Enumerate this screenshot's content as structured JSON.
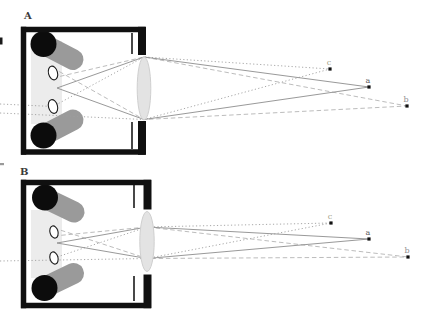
{
  "figure": {
    "canvas": {
      "width": 431,
      "height": 323,
      "bg": "#ffffff"
    },
    "colors": {
      "wall": "#101010",
      "septum": "#1a1a1a",
      "slab": "#ececec",
      "shaft": "#9a9a9a",
      "cap": "#0c0c0c",
      "aperture_fill": "#ffffff",
      "aperture_stroke": "#1c1c1c",
      "lens_fill": "#e3e3e3",
      "lens_stroke": "#cfcfcf",
      "ray_solid": "#8d8d8d",
      "ray_dashed": "#b4b4b4",
      "ray_dotted": "#9e9e9e",
      "point": "#111111",
      "panel_label": "#3a3a3a"
    },
    "edge_marks": [
      {
        "x": 0,
        "y": 37.5,
        "w": 2.5,
        "h": 7,
        "color": "#1a1a1a"
      },
      {
        "x": 0,
        "y": 163,
        "w": 4,
        "h": 2.2,
        "color": "#9a9a9a"
      }
    ],
    "panels": [
      {
        "id": "a",
        "label": "A",
        "label_xy": [
          24,
          19
        ],
        "slab": [
          31,
          41,
          31,
          83
        ],
        "cylinders": [
          {
            "cap": [
              43.5,
              44,
              13
            ],
            "shaft": [
              46,
              45.5,
              73,
              59.5
            ],
            "shaft_w": 21
          },
          {
            "cap": [
              43.5,
              135.5,
              13
            ],
            "shaft": [
              46,
              134,
              73,
              120
            ],
            "shaft_w": 21
          }
        ],
        "apertures": [
          {
            "c": [
              53,
              73
            ],
            "r": [
              4.5,
              7
            ],
            "rot": -15
          },
          {
            "c": [
              53,
              106.5
            ],
            "r": [
              4.5,
              7
            ],
            "rot": -15
          }
        ],
        "walls": [
          [
            21,
            29.5,
            145.5,
            29.5,
            5.5
          ],
          [
            23.5,
            26.8,
            23.5,
            154.8,
            5.5
          ],
          [
            21,
            152,
            145.5,
            152,
            5.5
          ],
          [
            142,
            26.8,
            142,
            55,
            8
          ],
          [
            142,
            121,
            142,
            154.8,
            8
          ]
        ],
        "septum": [
          [
            132,
            33,
            132,
            54
          ],
          [
            132,
            122,
            132,
            149
          ]
        ],
        "lens": {
          "c": [
            144,
            88.5
          ],
          "r": [
            6.8,
            31.5
          ]
        },
        "rays": [
          {
            "style": "dotted",
            "pts": [
              [
                0,
                113
              ],
              [
                144,
                119.5
              ],
              [
                330,
                69
              ]
            ]
          },
          {
            "style": "dotted",
            "pts": [
              [
                0,
                104
              ],
              [
                53,
                106.5
              ],
              [
                144,
                57
              ],
              [
                330,
                69
              ]
            ]
          },
          {
            "style": "dashed",
            "pts": [
              [
                53,
                78
              ],
              [
                144,
                57
              ],
              [
                407,
                106
              ]
            ]
          },
          {
            "style": "dashed",
            "pts": [
              [
                53,
                68
              ],
              [
                144,
                119.5
              ],
              [
                407,
                106
              ]
            ]
          },
          {
            "style": "solid",
            "pts": [
              [
                57,
                88
              ],
              [
                144,
                57
              ],
              [
                369,
                87
              ]
            ]
          },
          {
            "style": "solid",
            "pts": [
              [
                57,
                88
              ],
              [
                144,
                119.5
              ],
              [
                369,
                87
              ]
            ]
          }
        ],
        "points": [
          {
            "label": "c",
            "xy": [
              330,
              69
            ],
            "label_xy": [
              329,
              65
            ],
            "label_color": "#9f9f88"
          },
          {
            "label": "a",
            "xy": [
              369,
              87
            ],
            "label_xy": [
              368,
              83
            ],
            "label_color": "#5e5e5e"
          },
          {
            "label": "b",
            "xy": [
              407,
              106
            ],
            "label_xy": [
              406,
              102
            ],
            "label_color": "#8f8f8f"
          }
        ]
      },
      {
        "id": "b",
        "label": "B",
        "label_xy": [
          20,
          175
        ],
        "slab": [
          31,
          210,
          31,
          68
        ],
        "cylinders": [
          {
            "cap": [
              45,
              197.5,
              13
            ],
            "shaft": [
              47,
              199,
              74,
              212
            ],
            "shaft_w": 21
          },
          {
            "cap": [
              44.5,
              288,
              13
            ],
            "shaft": [
              46.5,
              286.5,
              73.5,
              273.5
            ],
            "shaft_w": 21
          }
        ],
        "apertures": [
          {
            "c": [
              54,
              232
            ],
            "r": [
              4,
              6.2
            ],
            "rot": -15
          },
          {
            "c": [
              54,
              258
            ],
            "r": [
              4,
              6.2
            ],
            "rot": -15
          }
        ],
        "walls": [
          [
            21,
            182.5,
            151,
            182.5,
            5.5
          ],
          [
            23.5,
            179.8,
            23.5,
            308.2,
            5.5
          ],
          [
            21,
            305.5,
            151,
            305.5,
            5.5
          ],
          [
            147.5,
            179.8,
            147.5,
            209.5,
            8
          ],
          [
            147.5,
            274.5,
            147.5,
            308.2,
            8
          ]
        ],
        "septum": [
          [
            134,
            185,
            134,
            208
          ],
          [
            134,
            276,
            134,
            301
          ]
        ],
        "lens": {
          "c": [
            147,
            241.5
          ],
          "r": [
            7.2,
            30
          ]
        },
        "rays": [
          {
            "style": "dotted",
            "pts": [
              [
                0,
                261
              ],
              [
                147,
                258.5
              ],
              [
                331,
                223
              ]
            ]
          },
          {
            "style": "dotted",
            "pts": [
              [
                54,
                258
              ],
              [
                147,
                227
              ],
              [
                331,
                223
              ]
            ]
          },
          {
            "style": "dashed",
            "pts": [
              [
                54,
                236
              ],
              [
                147,
                227
              ],
              [
                408,
                257
              ]
            ]
          },
          {
            "style": "dashed",
            "pts": [
              [
                54,
                228
              ],
              [
                147,
                258.5
              ],
              [
                408,
                257
              ]
            ]
          },
          {
            "style": "solid",
            "pts": [
              [
                57,
                243
              ],
              [
                147,
                227
              ],
              [
                369,
                239
              ]
            ]
          },
          {
            "style": "solid",
            "pts": [
              [
                57,
                243
              ],
              [
                147,
                258.5
              ],
              [
                369,
                239
              ]
            ]
          }
        ],
        "points": [
          {
            "label": "c",
            "xy": [
              331,
              223
            ],
            "label_xy": [
              330,
              219
            ],
            "label_color": "#9f9f88"
          },
          {
            "label": "a",
            "xy": [
              369,
              239
            ],
            "label_xy": [
              368,
              235
            ],
            "label_color": "#5e5e5e"
          },
          {
            "label": "b",
            "xy": [
              408,
              257
            ],
            "label_xy": [
              407,
              253
            ],
            "label_color": "#8f8f8f"
          }
        ]
      }
    ]
  }
}
